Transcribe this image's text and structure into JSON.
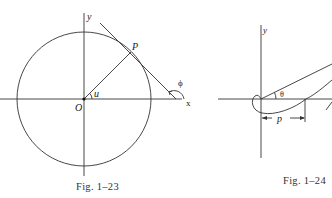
{
  "figures": [
    {
      "id": "fig-1-23",
      "caption": "Fig. 1–23",
      "labels": {
        "y_axis": "y",
        "x_axis": "x",
        "point": "P",
        "origin": "O",
        "angle_u": "u",
        "angle_phi": "ϕ"
      },
      "elements": [
        "circle centered at origin",
        "radius OP at angle u",
        "tangent line at P",
        "angle ϕ between tangent and x-axis"
      ]
    },
    {
      "id": "fig-1-24",
      "caption": "Fig. 1–24",
      "labels": {
        "y_axis": "y",
        "angle_theta": "θ",
        "distance": "p"
      },
      "elements": [
        "looped curve through origin",
        "ray at angle θ",
        "dimension arrow p along x-axis"
      ]
    }
  ],
  "colors": {
    "ink": "#222222",
    "background": "#ffffff"
  }
}
